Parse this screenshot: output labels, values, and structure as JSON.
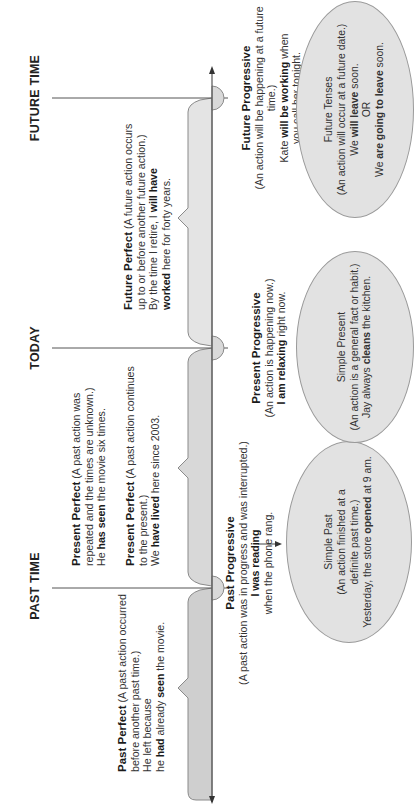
{
  "diagram": {
    "type": "verb-tense-timeline",
    "orientation": "rotated-90-ccw",
    "colors": {
      "axis": "#555555",
      "bracket_fill_past": "#cfcfcf",
      "bracket_fill_present": "#d8d8d8",
      "bracket_fill_future": "#e4e4e4",
      "marker_fill": "#d9d9d9",
      "ellipse_fill": "#e2e2e2",
      "ellipse_border": "#9a9a9a"
    },
    "time_markers": [
      {
        "id": "past",
        "label": "PAST TIME"
      },
      {
        "id": "today",
        "label": "TODAY"
      },
      {
        "id": "future",
        "label": "FUTURE TIME"
      }
    ],
    "perfect_tenses": {
      "past_perfect": {
        "title": "Past Perfect",
        "desc1": " (A past action occurred",
        "desc2": "before another past time.)",
        "ex1": "He left because",
        "ex2_pre": "he ",
        "ex2_b1": "had",
        "ex2_mid": " already ",
        "ex2_b2": "seen",
        "ex2_post": " the movie."
      },
      "present_perfect_repeated": {
        "title": "Present Perfect",
        "desc1": " (A past action was",
        "desc2": "repeated and the times are unknown.)",
        "ex_pre": "He ",
        "ex_b": "has seen",
        "ex_post": " the movie six times."
      },
      "present_perfect_continues": {
        "title": "Present Perfect",
        "desc1": " (A past action continues",
        "desc2": "to the present.)",
        "ex_pre": "We ",
        "ex_b": "have lived",
        "ex_post": " here since 2003."
      },
      "future_perfect": {
        "title": "Future Perfect",
        "desc1": " (A future action occurs",
        "desc2": "up to or before another future action.)",
        "ex1_pre": "By the time I retire, I ",
        "ex1_b": "will have",
        "ex2_b": "worked",
        "ex2_post": " here for forty years."
      }
    },
    "progressive_tenses": {
      "past_progressive": {
        "title": "Past Progressive",
        "desc": "(A past action was in progress and was interrupted.)",
        "ex1_b": "I was reading",
        "ex2": "when the phone rang."
      },
      "present_progressive": {
        "title": "Present Progressive",
        "desc": "(An action is happening now.)",
        "ex_b": "I am relaxing",
        "ex_post": " right now."
      },
      "future_progressive": {
        "title": "Future Progressive",
        "desc": "(An action will be happening at a future time.)",
        "ex1_pre": "Kate ",
        "ex1_b": "will be working",
        "ex1_post": " when",
        "ex2": "you call her tonight."
      }
    },
    "simple_tenses": {
      "simple_past": {
        "title": "Simple Past",
        "desc1": "(An action finished at a",
        "desc2": "definite past time.)",
        "ex_pre": "Yesterday, the store ",
        "ex_b": "opened",
        "ex_post": " at 9 am."
      },
      "simple_present": {
        "title": "Simple Present",
        "desc": "(An action is a general fact or habit.)",
        "ex_pre": "Jay always ",
        "ex_b": "cleans",
        "ex_post": " the kitchen."
      },
      "future_tenses": {
        "title": "Future Tenses",
        "desc": "(An action will occur at a future date.)",
        "ex1_pre": "We ",
        "ex1_b": "will leave",
        "ex1_post": " soon.",
        "or": "OR",
        "ex2_pre": "We ",
        "ex2_b": "are going to leave",
        "ex2_post": " soon."
      }
    }
  }
}
